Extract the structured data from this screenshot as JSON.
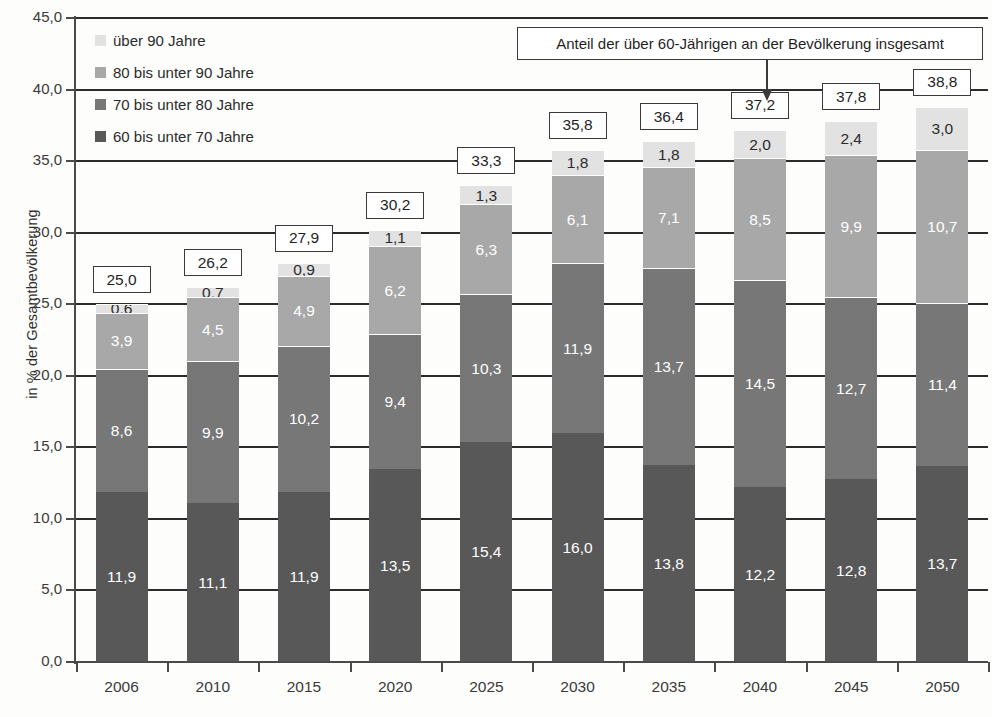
{
  "chart_data": {
    "type": "bar",
    "stacked": true,
    "title": "",
    "xlabel": "",
    "ylabel": "in % der Gesamtbevölkerung",
    "ylim": [
      0,
      45
    ],
    "ytick_step": 5,
    "ytick_labels": [
      "0,0",
      "5,0",
      "10,0",
      "15,0",
      "20,0",
      "25,0",
      "30,0",
      "35,0",
      "40,0",
      "45,0"
    ],
    "grid": true,
    "legend_position": "top-left",
    "categories": [
      "2006",
      "2010",
      "2015",
      "2020",
      "2025",
      "2030",
      "2035",
      "2040",
      "2045",
      "2050"
    ],
    "series": [
      {
        "name": "60 bis unter 70 Jahre",
        "color": "#585858",
        "values": [
          11.9,
          11.1,
          11.9,
          13.5,
          15.4,
          16.0,
          13.8,
          12.2,
          12.8,
          13.7
        ],
        "labels": [
          "11,9",
          "11,1",
          "11,9",
          "13,5",
          "15,4",
          "16,0",
          "13,8",
          "12,2",
          "12,8",
          "13,7"
        ]
      },
      {
        "name": "70 bis unter 80 Jahre",
        "color": "#777777",
        "values": [
          8.6,
          9.9,
          10.2,
          9.4,
          10.3,
          11.9,
          13.7,
          14.5,
          12.7,
          11.4
        ],
        "labels": [
          "8,6",
          "9,9",
          "10,2",
          "9,4",
          "10,3",
          "11,9",
          "13,7",
          "14,5",
          "12,7",
          "11,4"
        ]
      },
      {
        "name": "80 bis unter 90 Jahre",
        "color": "#a8a8a8",
        "values": [
          3.9,
          4.5,
          4.9,
          6.2,
          6.3,
          6.1,
          7.1,
          8.5,
          9.9,
          10.7
        ],
        "labels": [
          "3,9",
          "4,5",
          "4,9",
          "6,2",
          "6,3",
          "6,1",
          "7,1",
          "8,5",
          "9,9",
          "10,7"
        ]
      },
      {
        "name": "über 90 Jahre",
        "color": "#e2e2e2",
        "values": [
          0.6,
          0.7,
          0.9,
          1.1,
          1.3,
          1.8,
          1.8,
          2.0,
          2.4,
          3.0
        ],
        "labels": [
          "0,6",
          "0,7",
          "0,9",
          "1,1",
          "1,3",
          "1,8",
          "1,8",
          "2,0",
          "2,4",
          "3,0"
        ]
      }
    ],
    "totals": [
      25.0,
      26.2,
      27.9,
      30.2,
      33.3,
      35.8,
      36.4,
      37.2,
      37.8,
      38.8
    ],
    "total_labels": [
      "25,0",
      "26,2",
      "27,9",
      "30,2",
      "33,3",
      "35,8",
      "36,4",
      "37,2",
      "37,8",
      "38,8"
    ],
    "annotation": {
      "text": "Anteil der über 60-Jährigen an der Bevölkerung insgesamt",
      "points_to_category": "2040"
    }
  },
  "legend": {
    "items": [
      {
        "label": "über 90 Jahre",
        "color": "#e2e2e2"
      },
      {
        "label": "80 bis unter 90 Jahre",
        "color": "#a8a8a8"
      },
      {
        "label": "70 bis unter 80 Jahre",
        "color": "#777777"
      },
      {
        "label": "60 bis unter 70 Jahre",
        "color": "#585858"
      }
    ]
  },
  "axes": {
    "y_title": "in % der Gesamtbevölkerung",
    "y_ticks": [
      "45,0",
      "40,0",
      "35,0",
      "30,0",
      "25,0",
      "20,0",
      "15,0",
      "10,0",
      "5,0",
      "0,0"
    ],
    "x_ticks": [
      "2006",
      "2010",
      "2015",
      "2020",
      "2025",
      "2030",
      "2035",
      "2040",
      "2045",
      "2050"
    ]
  }
}
